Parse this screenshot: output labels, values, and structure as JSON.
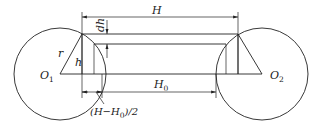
{
  "diagram": {
    "type": "geometric-dimension-drawing",
    "labels": {
      "H": "H",
      "H0_main": "H",
      "H0_sub": "0",
      "dh": "dh",
      "r": "r",
      "h": "h",
      "O1_main": "O",
      "O1_sub": "1",
      "O2_main": "O",
      "O2_sub": "2",
      "offset_prefix": "(H−H",
      "offset_sub": "0",
      "offset_suffix": ")/2"
    },
    "colors": {
      "stroke": "#222222",
      "background": "#ffffff"
    }
  }
}
